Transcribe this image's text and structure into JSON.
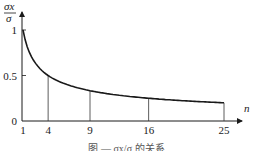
{
  "chart_data": {
    "type": "line",
    "title": "",
    "xlabel": "n",
    "ylabel": "σx/σ",
    "ylabel_numerator": "σx",
    "ylabel_denominator": "σ",
    "x": [
      1,
      4,
      9,
      16,
      25
    ],
    "series": [
      {
        "name": "σx/σ = 1/√n",
        "values": [
          1.0,
          0.5,
          0.333,
          0.25,
          0.2
        ]
      }
    ],
    "x_ticks": [
      "1",
      "4",
      "9",
      "16",
      "25"
    ],
    "y_ticks": [
      "0",
      "0.5",
      "1"
    ],
    "xlim": [
      1,
      27
    ],
    "ylim": [
      0,
      1.15
    ],
    "grid": false,
    "drop_lines_at": [
      4,
      9,
      16,
      25
    ],
    "origin_label": "0"
  },
  "caption": "图 — σx/σ 的关系"
}
